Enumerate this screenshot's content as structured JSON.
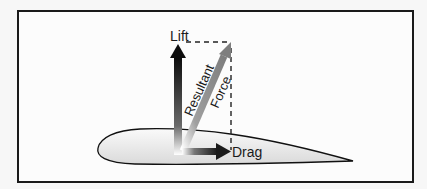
{
  "diagram": {
    "title": "",
    "labels": {
      "lift": "Lift",
      "drag": "Drag",
      "resultant_line1": "Resultant",
      "resultant_line2": "Force"
    },
    "colors": {
      "frame": "#1a1a1a",
      "lift_arrow": "#111111",
      "drag_arrow": "#222222",
      "resultant_arrow": "#8a8a8a",
      "airfoil_fill": "#e6e6e6",
      "airfoil_stroke": "#111111",
      "dashed_lines": "#222222"
    },
    "elements": [
      {
        "type": "airfoil",
        "name": "wing-cross-section"
      },
      {
        "type": "arrow",
        "name": "lift",
        "direction": "up"
      },
      {
        "type": "arrow",
        "name": "drag",
        "direction": "right"
      },
      {
        "type": "arrow",
        "name": "resultant-force",
        "direction": "up-right"
      },
      {
        "type": "dashed-line",
        "name": "lift-projection"
      },
      {
        "type": "dashed-line",
        "name": "drag-projection"
      }
    ]
  }
}
